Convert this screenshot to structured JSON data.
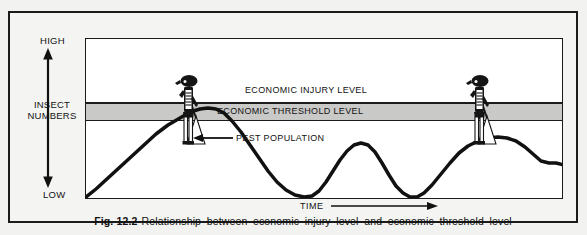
{
  "figure": {
    "caption_number": "Fig. 12.2",
    "caption_text": "Relationship between economic injury level and economic threshold level"
  },
  "axes": {
    "y_top_label": "HIGH",
    "y_bottom_label": "LOW",
    "y_axis_title": "INSECT NUMBERS",
    "x_axis_title": "TIME"
  },
  "bands": {
    "injury_label": "ECONOMIC INJURY LEVEL",
    "threshold_label": "ECONOMIC THRESHOLD LEVEL",
    "injury_color": "#ffffff",
    "threshold_color": "#c9c9c7",
    "line_color": "#1b1b1b"
  },
  "annotations": {
    "pest_population_label": "PEST POPULATION"
  },
  "icons": {
    "sprayer_left": "pesticide-sprayer-person-icon",
    "sprayer_right": "pesticide-sprayer-person-icon",
    "y_arrow": "double-headed-vertical-arrow-icon",
    "x_arrow": "right-arrow-icon",
    "pest_arrow": "left-arrow-icon"
  },
  "chart_data": {
    "type": "line",
    "title": "Relationship between economic injury level and economic threshold level",
    "xlabel": "TIME",
    "ylabel": "INSECT NUMBERS",
    "xlim": [
      0,
      478
    ],
    "ylim": [
      0,
      161
    ],
    "grid": false,
    "legend": null,
    "y_tick_labels": [
      "LOW",
      "HIGH"
    ],
    "reference_lines": [
      {
        "name": "ECONOMIC INJURY LEVEL",
        "y_pixel": 64,
        "style": "solid"
      },
      {
        "name": "ECONOMIC THRESHOLD LEVEL",
        "y_pixel_top": 64,
        "y_pixel_bottom": 82,
        "style": "shaded-band"
      }
    ],
    "series": [
      {
        "name": "PEST POPULATION",
        "points": [
          [
            0,
            158
          ],
          [
            10,
            150
          ],
          [
            22,
            139
          ],
          [
            34,
            128
          ],
          [
            46,
            117
          ],
          [
            58,
            106
          ],
          [
            70,
            95
          ],
          [
            82,
            86
          ],
          [
            94,
            79
          ],
          [
            104,
            73
          ],
          [
            114,
            70
          ],
          [
            122,
            69
          ],
          [
            130,
            70
          ],
          [
            138,
            74
          ],
          [
            146,
            82
          ],
          [
            155,
            93
          ],
          [
            164,
            106
          ],
          [
            173,
            119
          ],
          [
            182,
            132
          ],
          [
            191,
            143
          ],
          [
            200,
            151
          ],
          [
            209,
            156
          ],
          [
            218,
            158
          ],
          [
            226,
            157
          ],
          [
            233,
            152
          ],
          [
            240,
            143
          ],
          [
            247,
            132
          ],
          [
            254,
            121
          ],
          [
            261,
            112
          ],
          [
            268,
            106
          ],
          [
            275,
            104
          ],
          [
            282,
            106
          ],
          [
            289,
            113
          ],
          [
            296,
            124
          ],
          [
            303,
            136
          ],
          [
            310,
            147
          ],
          [
            317,
            154
          ],
          [
            324,
            158
          ],
          [
            331,
            158
          ],
          [
            338,
            154
          ],
          [
            346,
            146
          ],
          [
            355,
            135
          ],
          [
            364,
            124
          ],
          [
            373,
            114
          ],
          [
            382,
            107
          ],
          [
            392,
            102
          ],
          [
            402,
            99
          ],
          [
            412,
            98
          ],
          [
            421,
            99
          ],
          [
            430,
            102
          ],
          [
            439,
            108
          ],
          [
            447,
            115
          ],
          [
            455,
            122
          ],
          [
            463,
            124
          ],
          [
            470,
            124
          ],
          [
            478,
            126
          ]
        ],
        "peaks_reaching_threshold": [
          2
        ],
        "color": "#111111",
        "line_width": 3.5
      }
    ],
    "events": [
      {
        "name": "pesticide-application",
        "x_pixel": 28,
        "note": "sprayer figure above first major peak"
      },
      {
        "name": "pesticide-application",
        "x_pixel": 318,
        "note": "sprayer figure above later major peak"
      }
    ]
  }
}
